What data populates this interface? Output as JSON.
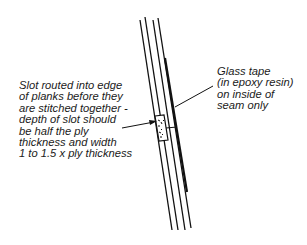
{
  "diagram": {
    "labels": {
      "slot": "Slot routed into edge\nof planks before they\nare stitched together -\ndepth of slot should\nbe half the ply\nthickness and width\n1 to 1.5 x ply thickness",
      "tape": "Glass tape\n(in epoxy resin)\non inside of\nseam only"
    },
    "colors": {
      "line": "#111111",
      "background": "#ffffff"
    }
  }
}
